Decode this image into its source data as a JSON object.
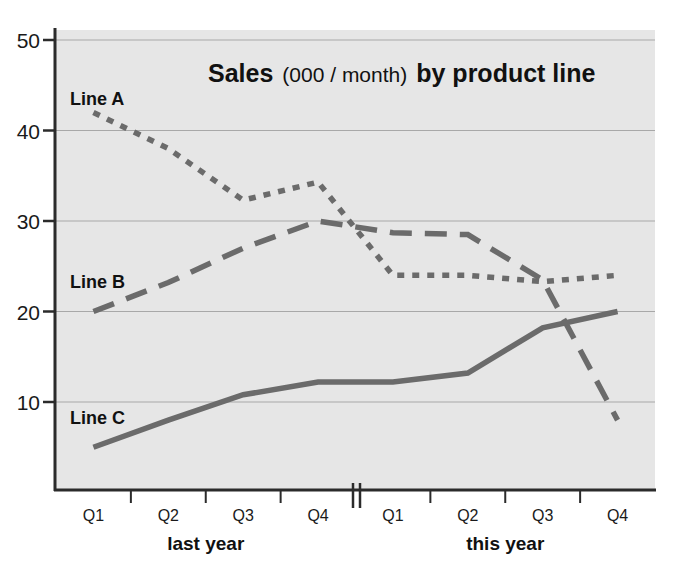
{
  "chart_data": {
    "type": "line",
    "title_parts": {
      "lead": "Sales",
      "paren": "(000 / month)",
      "trail": "by product line"
    },
    "xlabel": "",
    "ylabel": "",
    "grid": true,
    "legend_position": "inline-labels",
    "ylim": [
      0,
      50
    ],
    "yticks": [
      "10",
      "20",
      "30",
      "40",
      "50"
    ],
    "ytick_values": [
      10,
      20,
      30,
      40,
      50
    ],
    "categories": [
      "Q1",
      "Q2",
      "Q3",
      "Q4",
      "Q1",
      "Q2",
      "Q3",
      "Q4"
    ],
    "category_groups": [
      {
        "label": "last year",
        "from": 0,
        "to": 3
      },
      {
        "label": "this year",
        "from": 4,
        "to": 7
      }
    ],
    "axis_break_after_index": 3,
    "series": [
      {
        "name": "Line A",
        "style": "dotted",
        "color": "#6b6b6b",
        "values": [
          42,
          38,
          32.3,
          34.3,
          24,
          24,
          23.3,
          24
        ]
      },
      {
        "name": "Line B",
        "style": "dashed",
        "color": "#6b6b6b",
        "values": [
          20,
          23.2,
          27,
          30,
          28.7,
          28.5,
          23.5,
          8
        ]
      },
      {
        "name": "Line C",
        "style": "solid",
        "color": "#6b6b6b",
        "values": [
          5,
          8,
          10.8,
          12.2,
          12.2,
          13.2,
          18.2,
          20
        ]
      }
    ]
  },
  "plot": {
    "background_color": "#e6e6e6",
    "gridline_color": "#a8a8a8",
    "axis_color": "#2b2b2b"
  }
}
